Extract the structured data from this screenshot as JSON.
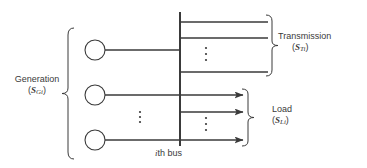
{
  "diagram": {
    "stroke_color": "#3a3a3a",
    "background_color": "#ffffff",
    "labels": {
      "generation": {
        "text": "Generation",
        "symbol_prefix": "(",
        "symbol_base": "S",
        "symbol_sub": "Gi",
        "symbol_suffix": ")"
      },
      "transmission": {
        "text": "Transmission",
        "symbol_prefix": "(",
        "symbol_base": "S",
        "symbol_sub": "Ti",
        "symbol_suffix": ")"
      },
      "load": {
        "text": "Load",
        "symbol_prefix": "(",
        "symbol_base": "S",
        "symbol_sub": "Li",
        "symbol_suffix": ")"
      },
      "bus": {
        "index": "i",
        "text": "th  bus"
      }
    },
    "generators": {
      "count": 3,
      "circle_radius": 10,
      "circle_cx": 95,
      "circle_cy": [
        50,
        95,
        140
      ],
      "lead_x_end": 180,
      "vertical_dots_x": 140,
      "vertical_dots_y": [
        112,
        117,
        122
      ]
    },
    "bus": {
      "x": 180,
      "y_top": 12,
      "y_bottom": 146
    },
    "transmission_lines": {
      "count": 3,
      "x_start": 180,
      "x_end": 268,
      "y": [
        22,
        38,
        72
      ],
      "vertical_dots_x": 206,
      "vertical_dots_y": [
        48,
        54,
        60
      ]
    },
    "load_lines": {
      "count": 3,
      "x_start": 180,
      "x_end": 243,
      "y": [
        95,
        112,
        140
      ],
      "arrow": true,
      "vertical_dots_x": 206,
      "vertical_dots_y": [
        118,
        124,
        130
      ]
    },
    "braces": {
      "generation": {
        "x": 68,
        "y_top": 28,
        "y_bottom": 159,
        "direction": "right"
      },
      "transmission": {
        "x": 272,
        "y_top": 15,
        "y_bottom": 76,
        "direction": "left"
      },
      "load": {
        "x": 248,
        "y_top": 89,
        "y_bottom": 146,
        "direction": "left"
      }
    }
  }
}
